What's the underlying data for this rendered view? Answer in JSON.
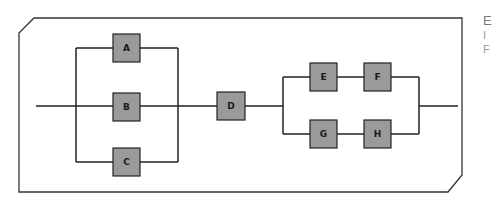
{
  "diagram": {
    "blocks": [
      {
        "id": "A",
        "label": "A"
      },
      {
        "id": "B",
        "label": "B"
      },
      {
        "id": "C",
        "label": "C"
      },
      {
        "id": "D",
        "label": "D"
      },
      {
        "id": "E",
        "label": "E"
      },
      {
        "id": "F",
        "label": "F"
      },
      {
        "id": "G",
        "label": "G"
      },
      {
        "id": "H",
        "label": "H"
      }
    ],
    "colors": {
      "block_fill": "#9a9a9a",
      "line": "#222222",
      "frame": "#333333"
    }
  },
  "side_text": {
    "line1": "E",
    "line2": "I",
    "line3": "F"
  }
}
